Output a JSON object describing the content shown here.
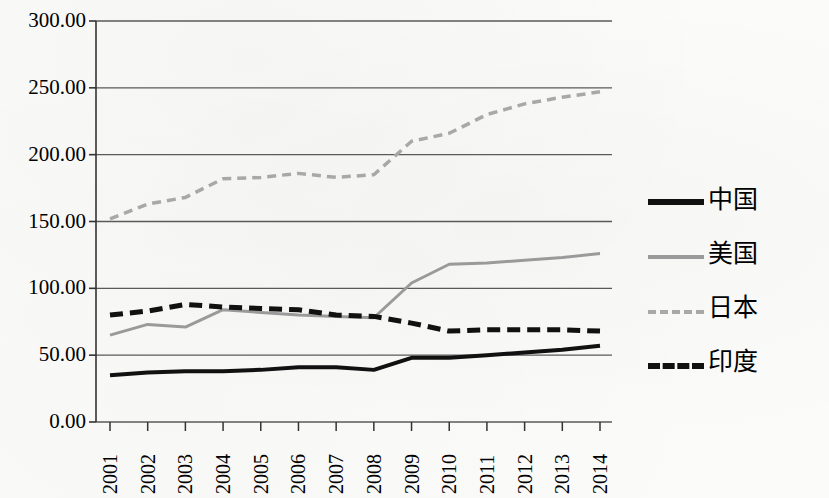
{
  "chart_data": {
    "type": "line",
    "title": "",
    "xlabel": "",
    "ylabel": "",
    "x": [
      "2001",
      "2002",
      "2003",
      "2004",
      "2005",
      "2006",
      "2007",
      "2008",
      "2009",
      "2010",
      "2011",
      "2012",
      "2013",
      "2014"
    ],
    "categories": [
      "2001",
      "2002",
      "2003",
      "2004",
      "2005",
      "2006",
      "2007",
      "2008",
      "2009",
      "2010",
      "2011",
      "2012",
      "2013",
      "2014"
    ],
    "ylim": [
      0,
      300
    ],
    "ytick_values": [
      0,
      50,
      100,
      150,
      200,
      250,
      300
    ],
    "ytick_labels": [
      "0.00",
      "50.00",
      "100.00",
      "150.00",
      "200.00",
      "250.00",
      "300.00"
    ],
    "grid": true,
    "legend_position": "right",
    "series": [
      {
        "name": "中国",
        "style": "solid",
        "color": "#111111",
        "width": 4,
        "values": [
          35,
          37,
          38,
          38,
          39,
          41,
          41,
          39,
          48,
          48,
          50,
          52,
          54,
          57
        ]
      },
      {
        "name": "美国",
        "style": "solid",
        "color": "#9a9a9a",
        "width": 3,
        "values": [
          65,
          73,
          71,
          84,
          82,
          80,
          79,
          78,
          104,
          118,
          119,
          121,
          123,
          126
        ]
      },
      {
        "name": "日本",
        "style": "dashed",
        "color": "#a8a8a8",
        "width": 3.5,
        "values": [
          152,
          163,
          168,
          182,
          183,
          186,
          183,
          185,
          210,
          216,
          230,
          238,
          243,
          247
        ]
      },
      {
        "name": "印度",
        "style": "dashed",
        "color": "#111111",
        "width": 5,
        "values": [
          80,
          83,
          88,
          86,
          85,
          84,
          80,
          79,
          74,
          68,
          69,
          69,
          69,
          68
        ]
      }
    ]
  },
  "axes": {
    "y_ticks": [
      {
        "label": "300.00",
        "value": 300
      },
      {
        "label": "250.00",
        "value": 250
      },
      {
        "label": "200.00",
        "value": 200
      },
      {
        "label": "150.00",
        "value": 150
      },
      {
        "label": "100.00",
        "value": 100
      },
      {
        "label": "50.00",
        "value": 50
      },
      {
        "label": "0.00",
        "value": 0
      }
    ],
    "x_ticks": [
      {
        "label": "2001"
      },
      {
        "label": "2002"
      },
      {
        "label": "2003"
      },
      {
        "label": "2004"
      },
      {
        "label": "2005"
      },
      {
        "label": "2006"
      },
      {
        "label": "2007"
      },
      {
        "label": "2008"
      },
      {
        "label": "2009"
      },
      {
        "label": "2010"
      },
      {
        "label": "2011"
      },
      {
        "label": "2012"
      },
      {
        "label": "2013"
      },
      {
        "label": "2014"
      }
    ]
  },
  "legend": {
    "items": [
      {
        "label": "中国",
        "swatch": "solid-black"
      },
      {
        "label": "美国",
        "swatch": "solid-gray"
      },
      {
        "label": "日本",
        "swatch": "dash-gray"
      },
      {
        "label": "印度",
        "swatch": "dash-black"
      }
    ]
  },
  "colors": {
    "china": "#111111",
    "usa": "#9a9a9a",
    "japan": "#a8a8a8",
    "india": "#111111",
    "gridline": "#5a5a5a",
    "background": "#fbfbfa"
  }
}
